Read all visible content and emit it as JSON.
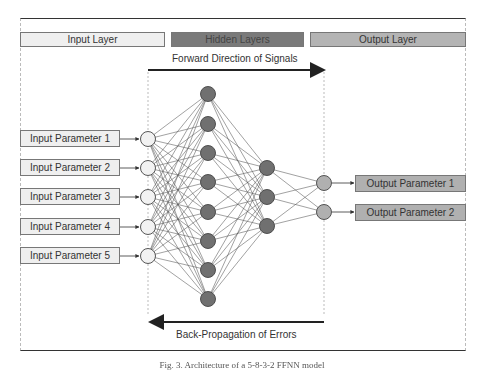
{
  "headers": {
    "input_layer": "Input Layer",
    "hidden_layers": "Hidden Layers",
    "output_layer": "Output Layer"
  },
  "arrows": {
    "forward_label": "Forward Direction of Signals",
    "backward_label": "Back-Propagation of Errors"
  },
  "inputs": [
    {
      "label": "Input Parameter 1"
    },
    {
      "label": "Input Parameter 2"
    },
    {
      "label": "Input Parameter 3"
    },
    {
      "label": "Input Parameter 4"
    },
    {
      "label": "Input Parameter 5"
    }
  ],
  "outputs": [
    {
      "label": "Output Parameter 1"
    },
    {
      "label": "Output Parameter 2"
    }
  ],
  "network": {
    "layers": [
      {
        "name": "input",
        "x": 148,
        "ys": [
          139,
          168,
          197,
          227,
          256
        ],
        "fill": "#f2f2f2"
      },
      {
        "name": "hidden1",
        "x": 208,
        "ys": [
          94,
          124,
          153,
          182,
          212,
          241,
          270,
          299
        ],
        "fill": "#707070"
      },
      {
        "name": "hidden2",
        "x": 267,
        "ys": [
          168,
          197,
          226
        ],
        "fill": "#707070"
      },
      {
        "name": "output",
        "x": 324,
        "ys": [
          183,
          212
        ],
        "fill": "#b0b0b0"
      }
    ],
    "node_radius": 7.5
  },
  "colors": {
    "input_fill": "#efefef",
    "hidden_fill": "#7a7a7a",
    "output_fill": "#b0b0b0"
  },
  "caption": "Fig. 3. Architecture of a 5-8-3-2 FFNN model"
}
